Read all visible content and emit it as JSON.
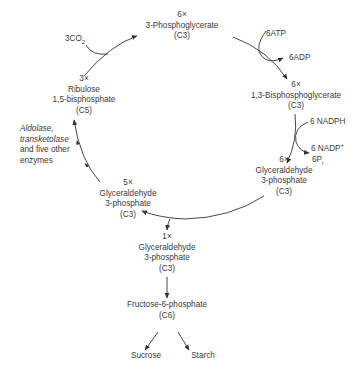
{
  "diagram": {
    "colors": {
      "text": "#3a3a3a",
      "arrow": "#333333",
      "background": "#ffffff"
    },
    "nodes": {
      "pga": {
        "count": "6×",
        "name": "3-Phosphoglycerate",
        "carbons": "(C3)"
      },
      "bpg": {
        "count": "6×",
        "name": "1,3-Bisphosphoglycerate",
        "carbons": "(C3)"
      },
      "gap6": {
        "count": "6×",
        "name1": "Glyceraldehyde",
        "name2": "3-phosphate",
        "carbons": "(C3)"
      },
      "gap5": {
        "count": "5×",
        "name1": "Glyceraldehyde",
        "name2": "3-phosphate",
        "carbons": "(C3)"
      },
      "rubp": {
        "count": "3×",
        "name1": "Ribulose",
        "name2": "1,5-bisphosphate",
        "carbons": "(C5)"
      },
      "gap1": {
        "count": "1×",
        "name1": "Glyceraldehyde",
        "name2": "3-phosphate",
        "carbons": "(C3)"
      },
      "f6p": {
        "name": "Fructose-6-phosphate",
        "carbons": "(C6)"
      },
      "sucrose": {
        "name": "Sucrose"
      },
      "starch": {
        "name": "Starch"
      }
    },
    "cofactors": {
      "co2": {
        "base": "3CO",
        "sub": "2"
      },
      "atp": "6ATP",
      "adp": "6ADP",
      "nadph": "6 NADPH",
      "nadp": {
        "base": "6 NADP",
        "sup": "+"
      },
      "pi": {
        "base": "6P",
        "sub": "i"
      }
    },
    "enzymes": {
      "line1": "Aldolase,",
      "line2": "transketolase",
      "line3": "and five other",
      "line4": "enzymes"
    }
  }
}
